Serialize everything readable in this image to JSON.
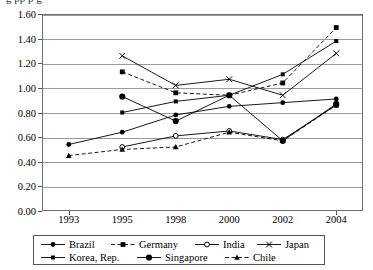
{
  "title_sliver": "g            pp                p    g",
  "chart_data": {
    "type": "line",
    "title": "",
    "xlabel": "",
    "ylabel": "",
    "x": [
      "1993",
      "1995",
      "1998",
      "2000",
      "2002",
      "2004"
    ],
    "categories": [
      "1993",
      "1995",
      "1998",
      "2000",
      "2002",
      "2004"
    ],
    "ylim": [
      0.0,
      1.6
    ],
    "yticks": [
      "0.00",
      "0.20",
      "0.40",
      "0.60",
      "0.80",
      "1.00",
      "1.20",
      "1.40",
      "1.60"
    ],
    "ytick_values": [
      0.0,
      0.2,
      0.4,
      0.6,
      0.8,
      1.0,
      1.2,
      1.4,
      1.6
    ],
    "grid": true,
    "legend_position": "bottom",
    "series": [
      {
        "name": "Brazil",
        "marker": "filled-circle",
        "dash": "solid",
        "values": [
          0.54,
          0.64,
          0.78,
          0.85,
          0.88,
          0.91
        ]
      },
      {
        "name": "Germany",
        "marker": "filled-square",
        "dash": "dashed",
        "values": [
          null,
          1.13,
          0.96,
          0.94,
          1.04,
          1.49
        ]
      },
      {
        "name": "India",
        "marker": "open-circle",
        "dash": "solid",
        "values": [
          null,
          0.52,
          0.61,
          0.65,
          0.58,
          0.86
        ]
      },
      {
        "name": "Japan",
        "marker": "cross",
        "dash": "solid",
        "values": [
          null,
          1.26,
          1.02,
          1.07,
          0.94,
          1.28
        ]
      },
      {
        "name": "Korea, Rep.",
        "marker": "filled-square-small",
        "dash": "solid",
        "values": [
          null,
          0.8,
          0.89,
          0.94,
          1.11,
          1.38
        ]
      },
      {
        "name": "Singapore",
        "marker": "filled-circle-large",
        "dash": "solid",
        "values": [
          null,
          0.93,
          0.73,
          0.94,
          0.57,
          0.87
        ]
      },
      {
        "name": "Chile",
        "marker": "filled-triangle",
        "dash": "dashed",
        "values": [
          0.45,
          0.5,
          0.52,
          0.64,
          0.57,
          0.86
        ]
      }
    ]
  },
  "legend": {
    "row1": [
      {
        "label": "Brazil",
        "marker": "filled-circle",
        "dash": "solid"
      },
      {
        "label": "Germany",
        "marker": "filled-square",
        "dash": "dashed"
      },
      {
        "label": "India",
        "marker": "open-circle",
        "dash": "solid"
      },
      {
        "label": "Japan",
        "marker": "cross",
        "dash": "solid"
      }
    ],
    "row2": [
      {
        "label": "Korea, Rep.",
        "marker": "filled-square-small",
        "dash": "solid"
      },
      {
        "label": "Singapore",
        "marker": "filled-circle-large",
        "dash": "solid"
      },
      {
        "label": "Chile",
        "marker": "filled-triangle",
        "dash": "dashed"
      }
    ]
  }
}
